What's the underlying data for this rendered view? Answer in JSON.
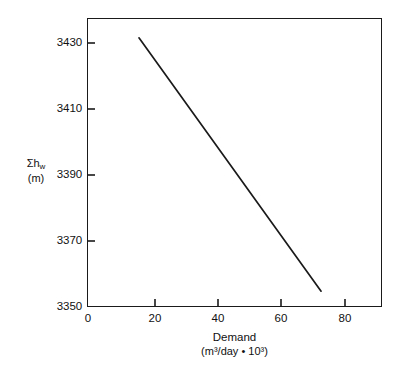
{
  "chart_data": {
    "type": "line",
    "title": "",
    "subtitle": "",
    "xlabel": "Demand",
    "xlabel_units": "(m³/day • 10³)",
    "ylabel": "Σh",
    "ylabel_subscript": "w",
    "ylabel_units": "(m)",
    "xlim": [
      0,
      92
    ],
    "ylim": [
      3350,
      3437.5
    ],
    "xticks": [
      0,
      20,
      40,
      60,
      80
    ],
    "xtick_labels": [
      "0",
      "20",
      "40",
      "60",
      "80"
    ],
    "yticks": [
      3350,
      3370,
      3390,
      3410,
      3430
    ],
    "ytick_labels": [
      "3350",
      "3370",
      "3390",
      "3410",
      "3430"
    ],
    "grid": false,
    "legend": false,
    "series": [
      {
        "name": "system head curve",
        "color": "#1a1a1a",
        "x": [
          16.2,
          73.0
        ],
        "y": [
          3431.5,
          3354.8
        ]
      }
    ],
    "annotations": []
  },
  "style": {
    "background": "#ffffff",
    "axis_color": "#1a1a1a",
    "line_color": "#1a1a1a",
    "text_color": "#111111"
  }
}
